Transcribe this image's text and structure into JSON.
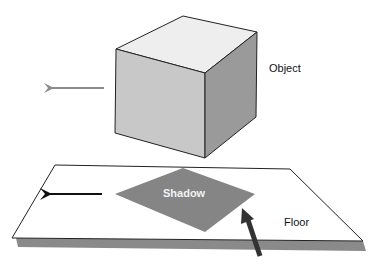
{
  "diagram": {
    "labels": {
      "object": "Object",
      "shadow": "Shadow",
      "floor": "Floor"
    },
    "colors": {
      "cube_top": "#eeeeee",
      "cube_front": "#c8c8c8",
      "cube_side": "#9a9a9a",
      "floor": "#ffffff",
      "floor_edge_shadow": "#8a8a8a",
      "shadow_fill": "#858585",
      "object_arrow": "#8c8c8c",
      "floor_arrow": "#111111",
      "light_arrow": "#333333"
    },
    "arrows": [
      {
        "name": "object-motion-arrow",
        "direction": "left"
      },
      {
        "name": "shadow-motion-arrow",
        "direction": "left"
      },
      {
        "name": "light-direction-arrow",
        "direction": "up-left"
      }
    ]
  }
}
